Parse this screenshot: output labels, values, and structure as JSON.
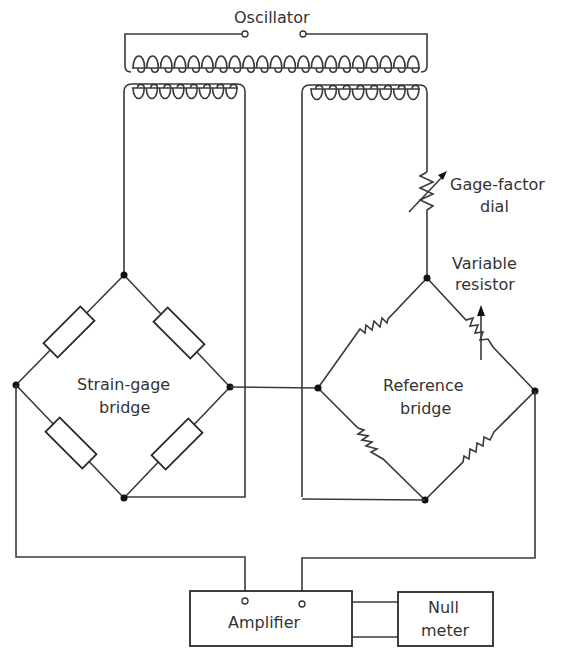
{
  "labels": {
    "oscillator": "Oscillator",
    "gage_factor_dial_line1": "Gage-factor",
    "gage_factor_dial_line2": "dial",
    "variable_resistor_line1": "Variable",
    "variable_resistor_line2": "resistor",
    "strain_gage_bridge_line1": "Strain-gage",
    "strain_gage_bridge_line2": "bridge",
    "reference_bridge_line1": "Reference",
    "reference_bridge_line2": "bridge",
    "amplifier": "Amplifier",
    "null_meter_line1": "Null",
    "null_meter_line2": "meter"
  },
  "colors": {
    "line": "#3a3a3a",
    "text": "#333333",
    "background": "#ffffff"
  },
  "components": {
    "transformer": {
      "primary_turns": 21,
      "secondary_left_turns": 8,
      "secondary_right_turns": 8
    },
    "strain_gage_bridge": {
      "elements": 4,
      "element_type": "rectangular-resistor"
    },
    "reference_bridge": {
      "elements": 4,
      "element_type": "zigzag-resistor",
      "variable_arm": "top-right"
    }
  }
}
